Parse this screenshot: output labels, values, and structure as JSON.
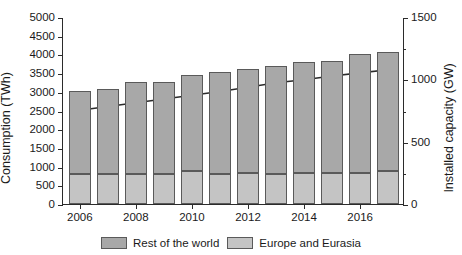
{
  "chart_data": {
    "type": "bar",
    "title": "",
    "xlabel": "",
    "ylabel": "Consumption (TWh)",
    "y2label": "Installed capacity (GW)",
    "categories": [
      2006,
      2007,
      2008,
      2009,
      2010,
      2011,
      2012,
      2013,
      2014,
      2015,
      2016,
      2017
    ],
    "xlim": [
      2005.4,
      2017.6
    ],
    "ylim": [
      0,
      5000
    ],
    "y2lim": [
      0,
      1500
    ],
    "ytick_values": [
      0,
      500,
      1000,
      1500,
      2000,
      2500,
      3000,
      3500,
      4000,
      4500,
      5000
    ],
    "ytick_labels": [
      "0",
      "500",
      "1000",
      "1500",
      "2000",
      "2500",
      "3000",
      "3500",
      "4000",
      "4500",
      "5000"
    ],
    "y2tick_values": [
      0,
      500,
      1000,
      1500
    ],
    "y2tick_labels": [
      "0",
      "500",
      "1000",
      "1500"
    ],
    "y2minor_values": [
      250,
      750,
      1250
    ],
    "xtick_values": [
      2006,
      2008,
      2010,
      2012,
      2014,
      2016
    ],
    "xtick_labels": [
      "2006",
      "2008",
      "2010",
      "2012",
      "2014",
      "2016"
    ],
    "grid": false,
    "legend_position": "bottom",
    "stacked": true,
    "series": [
      {
        "name": "Europe and Eurasia",
        "color": "#c4c4c4",
        "values": [
          800,
          800,
          810,
          800,
          870,
          790,
          820,
          800,
          840,
          830,
          830,
          880
        ]
      },
      {
        "name": "Rest of the world",
        "color": "#a8a8a8",
        "values": [
          2220,
          2270,
          2440,
          2450,
          2570,
          2730,
          2800,
          2900,
          2970,
          3000,
          3170,
          3180
        ]
      }
    ],
    "totals": [
      3020,
      3070,
      3250,
      3250,
      3440,
      3520,
      3620,
      3700,
      3810,
      3830,
      4000,
      4060
    ],
    "line_series": {
      "name": "Installed capacity",
      "color": "#2b2b2b",
      "axis": "right",
      "x": [
        2006,
        2007,
        2008,
        2009,
        2010,
        2011,
        2012,
        2013,
        2014,
        2015,
        2016,
        2017
      ],
      "values": [
        760,
        790,
        820,
        850,
        880,
        910,
        945,
        980,
        1005,
        1035,
        1060,
        1085
      ]
    }
  },
  "legend": {
    "items": [
      {
        "label": "Rest of the world",
        "color": "#a8a8a8"
      },
      {
        "label": "Europe and Eurasia",
        "color": "#c4c4c4"
      }
    ]
  }
}
